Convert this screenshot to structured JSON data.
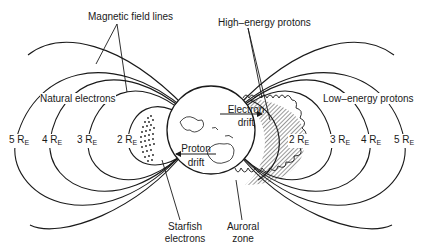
{
  "diagram": {
    "labels": {
      "magnetic_field_lines": "Magnetic field lines",
      "high_energy_protons": "High–energy protons",
      "natural_electrons": "Natural electrons",
      "low_energy_protons": "Low–energy protons",
      "electron_drift_1": "Electron",
      "electron_drift_2": "drift",
      "proton_drift_1": "Proton",
      "proton_drift_2": "drift",
      "starfish_1": "Starfish",
      "starfish_2": "electrons",
      "auroral_1": "Auroral",
      "auroral_2": "zone"
    },
    "radii_left": [
      {
        "num": "5",
        "unit": "R",
        "sub": "E"
      },
      {
        "num": "4",
        "unit": "R",
        "sub": "E"
      },
      {
        "num": "3",
        "unit": "R",
        "sub": "E"
      },
      {
        "num": "2",
        "unit": "R",
        "sub": "E"
      }
    ],
    "radii_right": [
      {
        "num": "2",
        "unit": "R",
        "sub": "E"
      },
      {
        "num": "3",
        "unit": "R",
        "sub": "E"
      },
      {
        "num": "4",
        "unit": "R",
        "sub": "E"
      },
      {
        "num": "5",
        "unit": "R",
        "sub": "E"
      }
    ],
    "colors": {
      "line": "#1a1a1a",
      "background": "#ffffff"
    }
  }
}
